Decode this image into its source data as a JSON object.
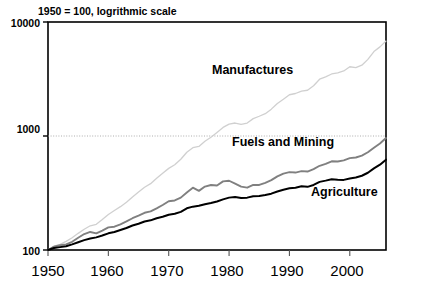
{
  "chart_data": {
    "type": "line",
    "title": "1950 = 100, logrithmic scale",
    "xlabel": "",
    "ylabel": "",
    "scale": "log",
    "grid": "horizontal-at-1000",
    "legend_position": "inline-annotations",
    "xlim": [
      1950,
      2006
    ],
    "ylim": [
      100,
      10000
    ],
    "ytick_labels": [
      "10000",
      "1000",
      "100"
    ],
    "ytick_values": [
      10000,
      1000,
      100
    ],
    "xtick_labels": [
      "1950",
      "1960",
      "1970",
      "1980",
      "1990",
      "2000"
    ],
    "xtick_values": [
      1950,
      1960,
      1970,
      1980,
      1990,
      2000
    ],
    "series": [
      {
        "name": "Manufactures",
        "color": "#d0d0d0",
        "label_x": 1975,
        "label_y": 3000,
        "x": [
          1950,
          1951,
          1952,
          1953,
          1954,
          1955,
          1956,
          1957,
          1958,
          1959,
          1960,
          1961,
          1962,
          1963,
          1964,
          1965,
          1966,
          1967,
          1968,
          1969,
          1970,
          1971,
          1972,
          1973,
          1974,
          1975,
          1976,
          1977,
          1978,
          1979,
          1980,
          1981,
          1982,
          1983,
          1984,
          1985,
          1986,
          1987,
          1988,
          1989,
          1990,
          1991,
          1992,
          1993,
          1994,
          1995,
          1996,
          1997,
          1998,
          1999,
          2000,
          2001,
          2002,
          2003,
          2004,
          2005,
          2006
        ],
        "values": [
          100,
          108,
          112,
          119,
          128,
          140,
          152,
          163,
          168,
          185,
          205,
          222,
          240,
          262,
          292,
          322,
          355,
          382,
          425,
          472,
          520,
          560,
          625,
          720,
          790,
          810,
          900,
          975,
          1075,
          1190,
          1270,
          1300,
          1265,
          1300,
          1420,
          1490,
          1570,
          1720,
          1930,
          2100,
          2300,
          2360,
          2480,
          2520,
          2760,
          3150,
          3300,
          3500,
          3580,
          3720,
          4050,
          3980,
          4180,
          4700,
          5500,
          6050,
          6800
        ]
      },
      {
        "name": "Fuels and Mining",
        "color": "#808080",
        "label_x": 1982,
        "label_y": 1300,
        "x": [
          1950,
          1951,
          1952,
          1953,
          1954,
          1955,
          1956,
          1957,
          1958,
          1959,
          1960,
          1961,
          1962,
          1963,
          1964,
          1965,
          1966,
          1967,
          1968,
          1969,
          1970,
          1971,
          1972,
          1973,
          1974,
          1975,
          1976,
          1977,
          1978,
          1979,
          1980,
          1981,
          1982,
          1983,
          1984,
          1985,
          1986,
          1987,
          1988,
          1989,
          1990,
          1991,
          1992,
          1993,
          1994,
          1995,
          1996,
          1997,
          1998,
          1999,
          2000,
          2001,
          2002,
          2003,
          2004,
          2005,
          2006
        ],
        "values": [
          100,
          107,
          110,
          112,
          118,
          128,
          138,
          144,
          140,
          148,
          158,
          160,
          168,
          178,
          190,
          200,
          212,
          218,
          232,
          248,
          268,
          272,
          288,
          320,
          352,
          330,
          360,
          372,
          368,
          400,
          405,
          382,
          360,
          352,
          372,
          372,
          388,
          410,
          442,
          468,
          482,
          478,
          492,
          488,
          512,
          548,
          570,
          600,
          598,
          612,
          640,
          648,
          672,
          720,
          790,
          860,
          960
        ]
      },
      {
        "name": "Agriculture",
        "color": "#000000",
        "label_x": 1992,
        "label_y": 400,
        "x": [
          1950,
          1951,
          1952,
          1953,
          1954,
          1955,
          1956,
          1957,
          1958,
          1959,
          1960,
          1961,
          1962,
          1963,
          1964,
          1965,
          1966,
          1967,
          1968,
          1969,
          1970,
          1971,
          1972,
          1973,
          1974,
          1975,
          1976,
          1977,
          1978,
          1979,
          1980,
          1981,
          1982,
          1983,
          1984,
          1985,
          1986,
          1987,
          1988,
          1989,
          1990,
          1991,
          1992,
          1993,
          1994,
          1995,
          1996,
          1997,
          1998,
          1999,
          2000,
          2001,
          2002,
          2003,
          2004,
          2005,
          2006
        ],
        "values": [
          100,
          104,
          106,
          108,
          112,
          117,
          122,
          126,
          129,
          134,
          140,
          144,
          150,
          156,
          164,
          170,
          178,
          182,
          190,
          196,
          204,
          208,
          216,
          232,
          240,
          244,
          252,
          258,
          266,
          278,
          288,
          292,
          286,
          288,
          296,
          298,
          304,
          312,
          326,
          338,
          348,
          352,
          362,
          358,
          372,
          396,
          406,
          418,
          414,
          412,
          424,
          432,
          448,
          476,
          520,
          560,
          620
        ]
      }
    ]
  }
}
